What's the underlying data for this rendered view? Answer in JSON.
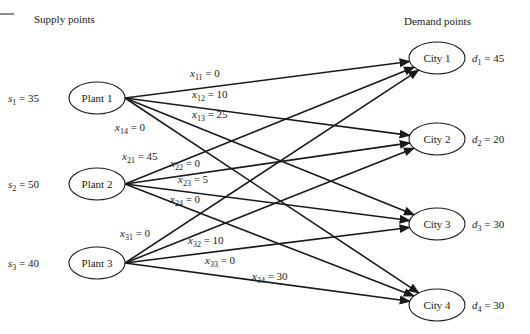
{
  "headings": {
    "supply": "Supply points",
    "demand": "Demand points"
  },
  "plants": [
    {
      "id": 1,
      "label": "Plant 1",
      "supply_var": "s",
      "supply_sub": "1",
      "supply_value": "35"
    },
    {
      "id": 2,
      "label": "Plant 2",
      "supply_var": "s",
      "supply_sub": "2",
      "supply_value": "50"
    },
    {
      "id": 3,
      "label": "Plant 3",
      "supply_var": "s",
      "supply_sub": "3",
      "supply_value": "40"
    }
  ],
  "cities": [
    {
      "id": 1,
      "label": "City 1",
      "demand_var": "d",
      "demand_sub": "1",
      "demand_value": "45"
    },
    {
      "id": 2,
      "label": "City 2",
      "demand_var": "d",
      "demand_sub": "2",
      "demand_value": "20"
    },
    {
      "id": 3,
      "label": "City 3",
      "demand_var": "d",
      "demand_sub": "3",
      "demand_value": "30"
    },
    {
      "id": 4,
      "label": "City 4",
      "demand_var": "d",
      "demand_sub": "4",
      "demand_value": "30"
    }
  ],
  "flows": [
    {
      "from": 1,
      "to": 1,
      "var": "x",
      "sub": "11",
      "value": "0"
    },
    {
      "from": 1,
      "to": 2,
      "var": "x",
      "sub": "12",
      "value": "10"
    },
    {
      "from": 1,
      "to": 3,
      "var": "x",
      "sub": "13",
      "value": "25"
    },
    {
      "from": 1,
      "to": 4,
      "var": "x",
      "sub": "14",
      "value": "0"
    },
    {
      "from": 2,
      "to": 1,
      "var": "x",
      "sub": "21",
      "value": "45"
    },
    {
      "from": 2,
      "to": 2,
      "var": "x",
      "sub": "22",
      "value": "0"
    },
    {
      "from": 2,
      "to": 3,
      "var": "x",
      "sub": "23",
      "value": "5"
    },
    {
      "from": 2,
      "to": 4,
      "var": "x",
      "sub": "24",
      "value": "0"
    },
    {
      "from": 3,
      "to": 1,
      "var": "x",
      "sub": "31",
      "value": "0"
    },
    {
      "from": 3,
      "to": 2,
      "var": "x",
      "sub": "32",
      "value": "10"
    },
    {
      "from": 3,
      "to": 3,
      "var": "x",
      "sub": "33",
      "value": "0"
    },
    {
      "from": 3,
      "to": 4,
      "var": "x",
      "sub": "34",
      "value": "30"
    }
  ]
}
